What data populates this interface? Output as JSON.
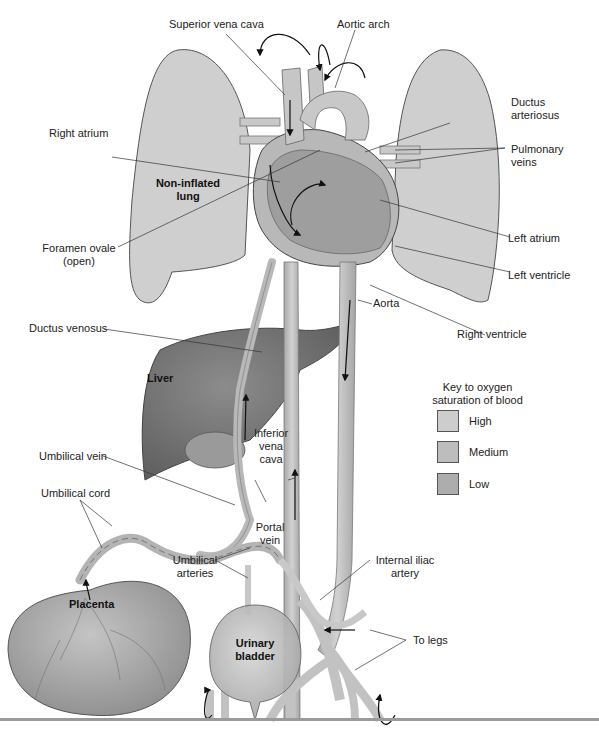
{
  "figure": {
    "colors": {
      "lung": "#cfcfcf",
      "liver": "#7c7c7c",
      "vessel": "#c4c4c4",
      "heart": "#b8b8b8",
      "placenta": "#a8a8a8",
      "bladder": "#c9c9c9",
      "line": "#333333",
      "rule": "#9a9a9a"
    }
  },
  "labels": {
    "superior_vena_cava": "Superior vena cava",
    "aortic_arch": "Aortic arch",
    "ductus_arteriosus_1": "Ductus",
    "ductus_arteriosus_2": "arteriosus",
    "pulmonary_veins_1": "Pulmonary",
    "pulmonary_veins_2": "veins",
    "right_atrium": "Right atrium",
    "non_inflated_lung_1": "Non-inflated",
    "non_inflated_lung_2": "lung",
    "foramen_ovale_1": "Foramen ovale",
    "foramen_ovale_2": "(open)",
    "left_atrium": "Left atrium",
    "left_ventricle": "Left ventricle",
    "right_ventricle": "Right ventricle",
    "aorta": "Aorta",
    "ductus_venosus": "Ductus venosus",
    "liver": "Liver",
    "inferior_vena_cava_1": "Inferior",
    "inferior_vena_cava_2": "vena",
    "inferior_vena_cava_3": "cava",
    "umbilical_vein": "Umbilical vein",
    "umbilical_cord": "Umbilical cord",
    "portal_vein_1": "Portal",
    "portal_vein_2": "vein",
    "umbilical_arteries_1": "Umbilical",
    "umbilical_arteries_2": "arteries",
    "internal_iliac_artery_1": "Internal iliac",
    "internal_iliac_artery_2": "artery",
    "placenta": "Placenta",
    "urinary_bladder_1": "Urinary",
    "urinary_bladder_2": "bladder",
    "to_legs": "To legs"
  },
  "legend": {
    "title_1": "Key to oxygen",
    "title_2": "saturation of blood",
    "items": [
      {
        "label": "High",
        "color": "#cdcdcd"
      },
      {
        "label": "Medium",
        "color": "#bdbdbd"
      },
      {
        "label": "Low",
        "color": "#adadad"
      }
    ]
  }
}
